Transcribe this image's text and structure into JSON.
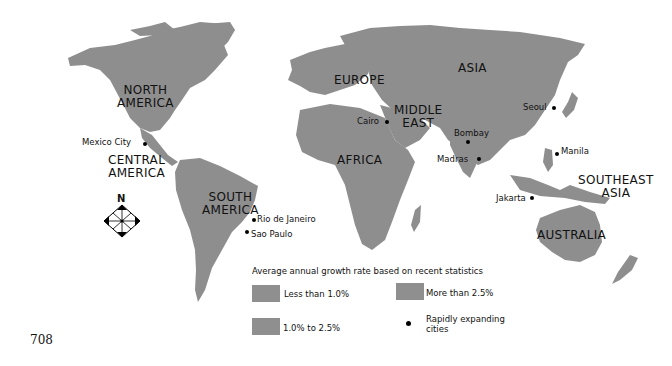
{
  "map": {
    "regions": [
      {
        "label": "NORTH\nAMERICA",
        "line1": "NORTH",
        "line2": "AMERICA"
      },
      {
        "label": "CENTRAL\nAMERICA",
        "line1": "CENTRAL",
        "line2": "AMERICA"
      },
      {
        "label": "SOUTH\nAMERICA",
        "line1": "SOUTH",
        "line2": "AMERICA"
      },
      {
        "label": "EUROPE",
        "line1": "EUROPE"
      },
      {
        "label": "ASIA",
        "line1": "ASIA"
      },
      {
        "label": "MIDDLE\nEAST",
        "line1": "MIDDLE",
        "line2": "EAST"
      },
      {
        "label": "AFRICA",
        "line1": "AFRICA"
      },
      {
        "label": "SOUTHEAST\nASIA",
        "line1": "SOUTHEAST",
        "line2": "ASIA"
      },
      {
        "label": "AUSTRALIA",
        "line1": "AUSTRALIA"
      }
    ],
    "cities": [
      {
        "name": "Mexico City"
      },
      {
        "name": "Rio de Janeiro"
      },
      {
        "name": "Sao Paulo"
      },
      {
        "name": "Cairo"
      },
      {
        "name": "Bombay"
      },
      {
        "name": "Madras"
      },
      {
        "name": "Seoul"
      },
      {
        "name": "Manila"
      },
      {
        "name": "Jakarta"
      }
    ],
    "compass": {
      "north_label": "N"
    },
    "land_color": "#8e8e8e"
  },
  "legend": {
    "title": "Average annual growth rate based on recent statistics",
    "items": [
      {
        "label": "Less than 1.0%",
        "color": "#8f8f8f"
      },
      {
        "label": "More than 2.5%",
        "color": "#8f8f8f"
      },
      {
        "label": "1.0% to 2.5%",
        "color": "#8f8f8f"
      },
      {
        "label": "Rapidly expanding cities",
        "line1": "Rapidly expanding",
        "line2": "cities",
        "symbol": "dot"
      }
    ]
  },
  "page_number": "708"
}
